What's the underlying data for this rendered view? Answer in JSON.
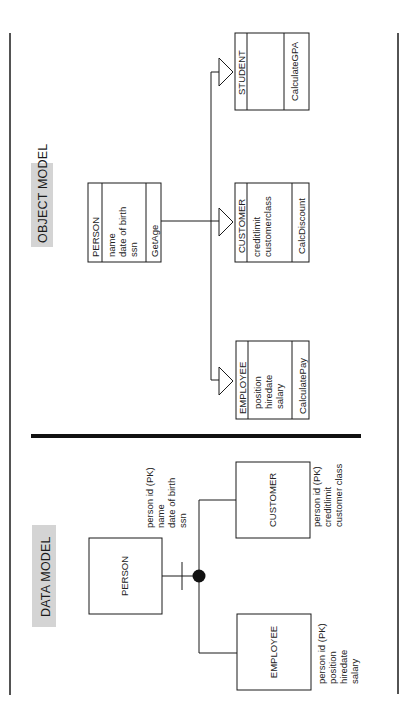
{
  "colors": {
    "ink": "#1a1a1a",
    "title_bg": "#d4d4d4",
    "background": "#ffffff"
  },
  "object_model": {
    "title": "OBJECT MODEL",
    "classes": [
      {
        "name": "PERSON",
        "attributes": [
          "name",
          "date of birth",
          "ssn"
        ],
        "methods": [
          "GetAge"
        ]
      },
      {
        "name": "STUDENT",
        "attributes": [],
        "methods": [
          "CalculateGPA"
        ]
      },
      {
        "name": "CUSTOMER",
        "attributes": [
          "creditlimit",
          "customerclass"
        ],
        "methods": [
          "CalcDiscount"
        ]
      },
      {
        "name": "EMPLOYEE",
        "attributes": [
          "position",
          "hiredate",
          "salary"
        ],
        "methods": [
          "CalculatePay"
        ]
      }
    ],
    "relationship": "inheritance"
  },
  "data_model": {
    "title": "DATA MODEL",
    "entities": [
      {
        "name": "PERSON",
        "attributes": [
          "person id (PK)",
          "name",
          "date of birth",
          "ssn"
        ]
      },
      {
        "name": "CUSTOMER",
        "attributes": [
          "person id (PK)",
          "creditlimit",
          "customer class"
        ]
      },
      {
        "name": "EMPLOYEE",
        "attributes": [
          "person id (PK)",
          "position",
          "hiredate",
          "salary"
        ]
      }
    ],
    "relationship": "subtype"
  }
}
